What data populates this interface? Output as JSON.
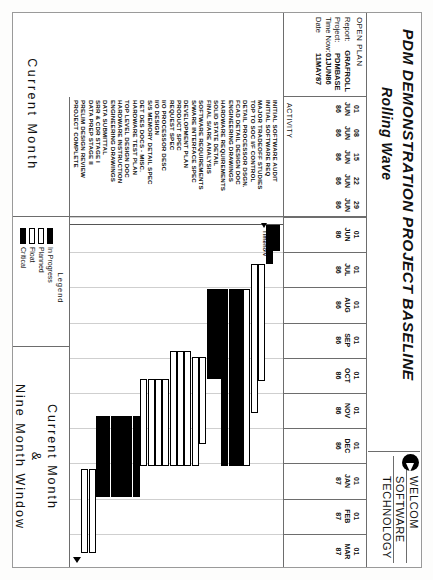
{
  "header": {
    "title": "PDM DEMONSTRATION PROJECT BASELINE",
    "subtitle": "Rolling Wave",
    "brand_line1": "WELCOM",
    "brand_line2": "SOFTWARE",
    "brand_line3": "TECHNOLOGY",
    "logo_name": "welcom-logo-icon"
  },
  "info": {
    "open_plan": "OPEN PLAN",
    "rows": [
      {
        "key": "Report:",
        "value": "GRAFROLL"
      },
      {
        "key": "Project:",
        "value": "PDMBASE"
      },
      {
        "key": "Time Now:",
        "value": "01JUN86"
      },
      {
        "key": "Date",
        "value": "11MAY87"
      }
    ]
  },
  "activity_header": "ACTIVITY",
  "timescale": {
    "ticks": [
      {
        "d": "01",
        "m": "JUN",
        "y": "86"
      },
      {
        "d": "01",
        "m": "JUL",
        "y": "86"
      },
      {
        "d": "01",
        "m": "AUG",
        "y": "86"
      },
      {
        "d": "01",
        "m": "SEP",
        "y": "86"
      },
      {
        "d": "01",
        "m": "OCT",
        "y": "86"
      },
      {
        "d": "01",
        "m": "NOV",
        "y": "86"
      },
      {
        "d": "01",
        "m": "DEC",
        "y": "86"
      },
      {
        "d": "01",
        "m": "JAN",
        "y": "87"
      },
      {
        "d": "01",
        "m": "FEB",
        "y": "87"
      },
      {
        "d": "01",
        "m": "MAR",
        "y": "87"
      }
    ],
    "left_ticks": [
      {
        "d": "01",
        "m": "JUN",
        "y": "86"
      },
      {
        "d": "08",
        "m": "JUN",
        "y": "86"
      },
      {
        "d": "15",
        "m": "JUN",
        "y": "86"
      },
      {
        "d": "22",
        "m": "JUN",
        "y": "86"
      },
      {
        "d": "29",
        "m": "JUN",
        "y": "86"
      }
    ],
    "time_now_label": "Timenow"
  },
  "legend": {
    "title": "Legend",
    "items": [
      {
        "label": "In Progress",
        "style": "inprog"
      },
      {
        "label": "Planned",
        "style": "planned"
      },
      {
        "label": "Float",
        "style": "float"
      },
      {
        "label": "Critical",
        "style": "crit"
      }
    ]
  },
  "footer": {
    "left_label": "Current Month",
    "right_line1": "Current Month",
    "right_line2": "&",
    "right_line3": "Nine Month Window"
  },
  "chart_data": {
    "type": "bar",
    "title": "PDM DEMONSTRATION PROJECT BASELINE",
    "subtitle": "Rolling Wave",
    "xlabel": "",
    "ylabel": "ACTIVITY",
    "xlim": [
      "1986-06-01",
      "1987-03-31"
    ],
    "grid": true,
    "legend_position": "bottom-center",
    "categories": [
      "INITIAL SOFTWARE AUDIT",
      "INITIAL SOFTWARE REQ",
      "MAJOR TRADEOFF STUDIES",
      "TOP TO SOC I/F CONTROL",
      "DETAIL PROCESSOR DSGN.",
      "FCAD DETAIL DESIGN DOC",
      "ENGINEERING DRAWINGS",
      "HARDWARE REQUIREMENTS",
      "SOLID STATE DETAIL",
      "FINAL S/ARE ANALYSIS",
      "SOFTWARE REQUIREMENTS",
      "S/WARE INTERFACE SPEC",
      "DEVELOPMENT PLAN",
      "PRODUCT SPEC",
      "REQUEST SPEC",
      "I/O PROCESSOR DESC",
      "I/O DESIGN",
      "S/S MEMORY DETAIL SPEC",
      "DET DES DOCS - MISC.",
      "HARDWARE TEST PLAN",
      "TOP LEVEL DESIGN DOC",
      "HARDWARE INSTRUCTION",
      "ENGINEERING DRAWINGS",
      "DATA SUBMITTAL",
      "SRR & CDR STAGE I",
      "DATA PREP STAGE II",
      "PRELIM DESIGN REVIEW",
      "PROJECT COMPLETE"
    ],
    "bars": [
      {
        "activity": "INITIAL SOFTWARE AUDIT",
        "start": 0.5,
        "end": 2.2,
        "type": "critical"
      },
      {
        "activity": "INITIAL SOFTWARE REQ",
        "start": 0.5,
        "end": 3.0,
        "type": "critical"
      },
      {
        "activity": "MAJOR TRADEOFF STUDIES",
        "start": 3.0,
        "end": 10.5,
        "type": "planned"
      },
      {
        "activity": "TOP TO SOC I/F CONTROL",
        "start": 3.0,
        "end": 12.6,
        "type": "planned"
      },
      {
        "activity": "DETAIL PROCESSOR DSGN.",
        "start": 4.6,
        "end": 16.0,
        "type": "planned"
      },
      {
        "activity": "FCAD DETAIL DESIGN DOC",
        "start": 4.6,
        "end": 16.0,
        "type": "progress"
      },
      {
        "activity": "ENGINEERING DRAWINGS",
        "start": 4.6,
        "end": 16.0,
        "type": "progress"
      },
      {
        "activity": "HARDWARE REQUIREMENTS",
        "start": 4.6,
        "end": 16.0,
        "type": "progress"
      },
      {
        "activity": "SOLID STATE DETAIL",
        "start": 4.6,
        "end": 10.4,
        "type": "critical"
      },
      {
        "activity": "FINAL S/ARE ANALYSIS",
        "start": 4.6,
        "end": 10.4,
        "type": "critical"
      },
      {
        "activity": "SOFTWARE REQUIREMENTS",
        "start": 9.0,
        "end": 14.6,
        "type": "planned"
      },
      {
        "activity": "S/WARE INTERFACE SPEC",
        "start": 9.0,
        "end": 16.0,
        "type": "planned"
      },
      {
        "activity": "DEVELOPMENT PLAN",
        "start": 8.6,
        "end": 16.0,
        "type": "planned"
      },
      {
        "activity": "PRODUCT SPEC",
        "start": 8.6,
        "end": 16.0,
        "type": "planned"
      },
      {
        "activity": "REQUEST SPEC",
        "start": 8.6,
        "end": 16.0,
        "type": "planned"
      },
      {
        "activity": "I/O PROCESSOR DESC",
        "start": 10.4,
        "end": 16.0,
        "type": "planned"
      },
      {
        "activity": "I/O DESIGN",
        "start": 10.4,
        "end": 16.0,
        "type": "planned"
      },
      {
        "activity": "S/S MEMORY DETAIL SPEC",
        "start": 10.4,
        "end": 16.0,
        "type": "planned"
      },
      {
        "activity": "DET DES DOCS - MISC.",
        "start": 10.4,
        "end": 16.0,
        "type": "planned"
      },
      {
        "activity": "HARDWARE TEST PLAN",
        "start": 12.8,
        "end": 18.0,
        "type": "critical"
      },
      {
        "activity": "TOP LEVEL DESIGN DOC",
        "start": 12.8,
        "end": 18.0,
        "type": "critical"
      },
      {
        "activity": "HARDWARE INSTRUCTION",
        "start": 12.8,
        "end": 18.0,
        "type": "critical"
      },
      {
        "activity": "ENGINEERING DRAWINGS",
        "start": 12.8,
        "end": 18.0,
        "type": "critical"
      },
      {
        "activity": "DATA SUBMITTAL",
        "start": 12.8,
        "end": 18.0,
        "type": "critical"
      },
      {
        "activity": "SRR & CDR STAGE I",
        "start": 12.8,
        "end": 18.0,
        "type": "critical"
      },
      {
        "activity": "DATA PREP STAGE II",
        "start": 16.2,
        "end": 21.6,
        "type": "planned"
      },
      {
        "activity": "PRELIM DESIGN REVIEW",
        "start": 16.2,
        "end": 21.6,
        "type": "planned"
      },
      {
        "activity": "PROJECT COMPLETE",
        "start": 21.8,
        "end": 22.6,
        "type": "milestone"
      }
    ]
  }
}
